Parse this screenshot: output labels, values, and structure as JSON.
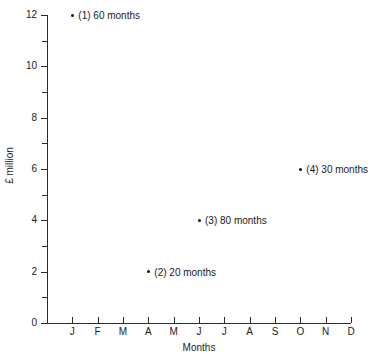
{
  "chart_data": {
    "type": "scatter",
    "title": "",
    "xlabel": "Months",
    "ylabel": "£ million",
    "xlim": [
      0,
      12
    ],
    "ylim": [
      0,
      12
    ],
    "grid": false,
    "legend": "none",
    "x_tick_labels": [
      "J",
      "F",
      "M",
      "A",
      "M",
      "J",
      "J",
      "A",
      "S",
      "O",
      "N",
      "D"
    ],
    "y_tick_labels": [
      "0",
      "2",
      "4",
      "6",
      "8",
      "10",
      "12"
    ],
    "y_major_ticks": [
      0,
      2,
      4,
      6,
      8,
      10,
      12
    ],
    "y_minor_ticks": [
      1,
      3,
      5,
      7,
      9,
      11
    ],
    "points": [
      {
        "id": "1",
        "label": "(1) 60 months",
        "month": "J",
        "x": 1,
        "y": 12
      },
      {
        "id": "2",
        "label": "(2) 20 months",
        "month": "A",
        "x": 4,
        "y": 2
      },
      {
        "id": "3",
        "label": "(3) 80 months",
        "month": "J",
        "x": 6,
        "y": 4
      },
      {
        "id": "4",
        "label": "(4) 30 months",
        "month": "O",
        "x": 10,
        "y": 6
      }
    ],
    "colors": {
      "marker": "#111111",
      "axis": "#2b2b2b",
      "text": "#1a1a1a",
      "background": "#ffffff"
    }
  }
}
